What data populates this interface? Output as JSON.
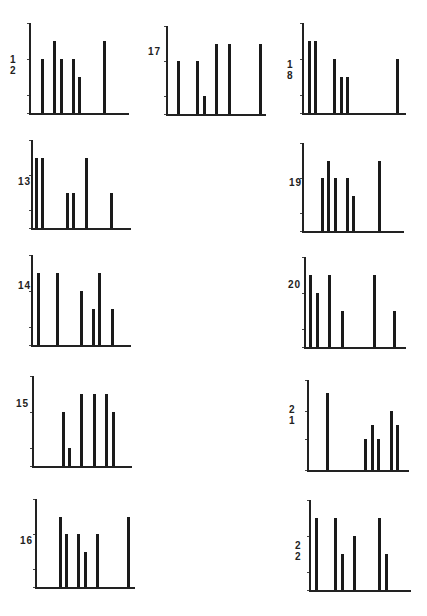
{
  "figure": {
    "unit_px": 17.5,
    "ticks": [
      0,
      1,
      3,
      5
    ]
  },
  "chart_data": [
    {
      "id": "12",
      "type": "bar",
      "title": "12",
      "axis": {
        "x": 29,
        "y": 113,
        "width": 100,
        "height": 90
      },
      "offsets": [
        13,
        25,
        32,
        44,
        50,
        75
      ],
      "values": [
        3,
        4,
        3,
        3,
        2,
        4
      ],
      "ylim": [
        0,
        5
      ],
      "yticks": [
        0,
        1,
        3,
        5
      ]
    },
    {
      "id": "17",
      "type": "bar",
      "title": "17",
      "axis": {
        "x": 166,
        "y": 114,
        "width": 100,
        "height": 88
      },
      "offsets": [
        12,
        31,
        38,
        50,
        63,
        94
      ],
      "values": [
        3,
        3,
        1,
        4,
        4,
        4
      ],
      "ylim": [
        0,
        5
      ],
      "yticks": [
        0,
        1,
        3,
        5
      ]
    },
    {
      "id": "18",
      "type": "bar",
      "title": "18",
      "axis": {
        "x": 302,
        "y": 113,
        "width": 104,
        "height": 90
      },
      "offsets": [
        7,
        13,
        32,
        39,
        45,
        95
      ],
      "values": [
        4,
        4,
        3,
        2,
        2,
        3
      ],
      "ylim": [
        0,
        5
      ],
      "yticks": [
        0,
        1,
        3,
        5
      ]
    },
    {
      "id": "13",
      "type": "bar",
      "title": "13",
      "axis": {
        "x": 31,
        "y": 228,
        "width": 100,
        "height": 88
      },
      "offsets": [
        5,
        11,
        36,
        42,
        55,
        80
      ],
      "values": [
        4,
        4,
        2,
        2,
        4,
        2
      ],
      "ylim": [
        0,
        5
      ],
      "yticks": [
        0,
        1,
        3,
        5
      ]
    },
    {
      "id": "19",
      "type": "bar",
      "title": "19",
      "axis": {
        "x": 302,
        "y": 231,
        "width": 102,
        "height": 88
      },
      "offsets": [
        20,
        26,
        33,
        45,
        51,
        77
      ],
      "values": [
        3,
        4,
        3,
        3,
        2,
        4
      ],
      "ylim": [
        0,
        5
      ],
      "yticks": [
        0,
        1,
        3,
        5
      ]
    },
    {
      "id": "14",
      "type": "bar",
      "title": "14",
      "axis": {
        "x": 31,
        "y": 345,
        "width": 100,
        "height": 90
      },
      "offsets": [
        7,
        26,
        50,
        62,
        68,
        81
      ],
      "values": [
        4,
        4,
        3,
        2,
        4,
        2
      ],
      "ylim": [
        0,
        5
      ],
      "yticks": [
        0,
        1,
        3,
        5
      ]
    },
    {
      "id": "20",
      "type": "bar",
      "title": "20",
      "axis": {
        "x": 304,
        "y": 347,
        "width": 102,
        "height": 90
      },
      "offsets": [
        6,
        13,
        25,
        38,
        70,
        90
      ],
      "values": [
        4,
        3,
        4,
        2,
        4,
        2
      ],
      "ylim": [
        0,
        5
      ],
      "yticks": [
        0,
        1,
        3,
        5
      ]
    },
    {
      "id": "15",
      "type": "bar",
      "title": "15",
      "axis": {
        "x": 32,
        "y": 466,
        "width": 100,
        "height": 90
      },
      "offsets": [
        31,
        37,
        49,
        62,
        74,
        81
      ],
      "values": [
        3,
        1,
        4,
        4,
        4,
        3
      ],
      "ylim": [
        0,
        5
      ],
      "yticks": [
        0,
        1,
        3,
        5
      ]
    },
    {
      "id": "21",
      "type": "bar",
      "title": "21",
      "axis": {
        "x": 307,
        "y": 470,
        "width": 102,
        "height": 90
      },
      "offsets": [
        20,
        58,
        65,
        71,
        84,
        90
      ],
      "values": [
        4.3,
        1.7,
        2.5,
        1.7,
        3.3,
        2.5
      ],
      "ylim": [
        0,
        5
      ],
      "yticks": [
        0,
        1.7,
        3.3,
        5
      ]
    },
    {
      "id": "16",
      "type": "bar",
      "title": "16",
      "axis": {
        "x": 35,
        "y": 587,
        "width": 100,
        "height": 88
      },
      "offsets": [
        25,
        31,
        43,
        50,
        62,
        93
      ],
      "values": [
        4,
        3,
        3,
        2,
        3,
        4
      ],
      "ylim": [
        0,
        5
      ],
      "yticks": [
        0,
        1,
        3,
        5
      ]
    },
    {
      "id": "22",
      "type": "bar",
      "title": "22",
      "axis": {
        "x": 309,
        "y": 590,
        "width": 102,
        "height": 90
      },
      "offsets": [
        7,
        26,
        33,
        45,
        70,
        77
      ],
      "values": [
        4,
        4,
        2,
        3,
        4,
        2
      ],
      "ylim": [
        0,
        5
      ],
      "yticks": [
        0,
        1,
        3,
        5
      ]
    }
  ],
  "labels": {
    "12": {
      "text": "1 2",
      "x": 10,
      "y": 62
    },
    "17": {
      "text": "17",
      "x": 148,
      "y": 54
    },
    "18": {
      "text": "1 8",
      "x": 287,
      "y": 67
    },
    "13": {
      "text": "13",
      "x": 18,
      "y": 184
    },
    "19": {
      "text": "19",
      "x": 289,
      "y": 185
    },
    "14": {
      "text": "14",
      "x": 18,
      "y": 288
    },
    "20": {
      "text": "20",
      "x": 288,
      "y": 287
    },
    "15": {
      "text": "15",
      "x": 16,
      "y": 406
    },
    "21": {
      "text": "2 1",
      "x": 289,
      "y": 412
    },
    "16": {
      "text": "16",
      "x": 20,
      "y": 543
    },
    "22": {
      "text": "2 2",
      "x": 295,
      "y": 548
    }
  }
}
